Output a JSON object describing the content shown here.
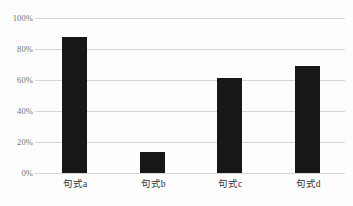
{
  "chart_data": {
    "type": "bar",
    "title": "",
    "xlabel": "",
    "ylabel": "",
    "categories": [
      "句式a",
      "句式b",
      "句式c",
      "句式d"
    ],
    "values": [
      88,
      13.5,
      61,
      69
    ],
    "ylim": [
      0,
      100
    ],
    "yticks": [
      0,
      20,
      40,
      60,
      80,
      100
    ],
    "ytick_labels": [
      "0%",
      "20%",
      "40%",
      "60%",
      "80%",
      "100%"
    ],
    "grid": true,
    "legend": false,
    "bar_color": "#171717",
    "gridline_color": "#d6d6d6",
    "background_color": "#fdfdfd",
    "tick_label_color": "#737373",
    "category_label_color": "#2e2e2e"
  }
}
